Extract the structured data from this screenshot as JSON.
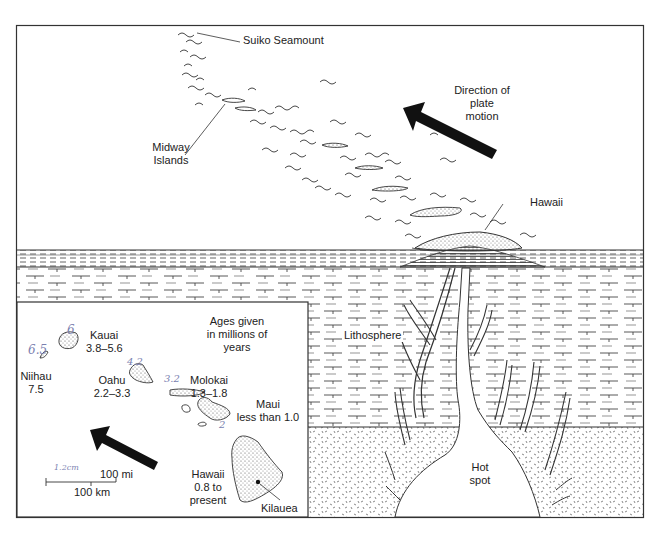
{
  "figure": {
    "colors": {
      "ink": "#222222",
      "paper": "#ffffff",
      "handwriting": "#7a7fb0",
      "stipple": "#555555"
    }
  },
  "cross_section": {
    "labels": {
      "suiko": "Suiko Seamount",
      "midway_line1": "Midway",
      "midway_line2": "Islands",
      "direction_line1": "Direction of",
      "direction_line2": "plate",
      "direction_line3": "motion",
      "hawaii": "Hawaii",
      "lithosphere": "Lithosphere",
      "hotspot_line1": "Hot",
      "hotspot_line2": "spot"
    },
    "layers": [
      "ocean",
      "lithosphere",
      "asthenosphere"
    ]
  },
  "inset_map": {
    "ages_note_line1": "Ages given",
    "ages_note_line2": "in millions of",
    "ages_note_line3": "years",
    "islands": [
      {
        "name": "Niihau",
        "age": "7.5",
        "handwritten": "6.5"
      },
      {
        "name": "Kauai",
        "age": "3.8–5.6",
        "handwritten": "6"
      },
      {
        "name": "Oahu",
        "age": "2.2–3.3",
        "handwritten": "4.2"
      },
      {
        "name": "Molokai",
        "age": "1.3–1.8",
        "handwritten": "3.2"
      },
      {
        "name": "Maui",
        "age": "less than 1.0",
        "handwritten": "2"
      },
      {
        "name": "Hawaii",
        "age_line1": "0.8 to",
        "age_line2": "present"
      }
    ],
    "kilauea": "Kilauea",
    "scale": {
      "miles": "100 mi",
      "km": "100 km",
      "handwritten": "1.2cm"
    }
  }
}
